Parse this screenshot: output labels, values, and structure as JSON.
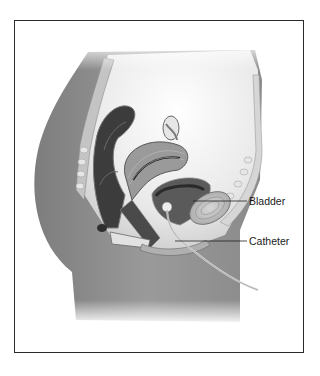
{
  "figure": {
    "labels": [
      {
        "id": "bladder",
        "text": "Bladder"
      },
      {
        "id": "catheter",
        "text": "Catheter"
      }
    ],
    "colors": {
      "frame_border": "#2a2a2a",
      "skin_tone": "#8c8c8c",
      "organ_mid": "#a9a9a9",
      "organ_dark": "#3a3a3a",
      "label_text": "#1a1a1a",
      "leader_line": "#222222"
    }
  }
}
